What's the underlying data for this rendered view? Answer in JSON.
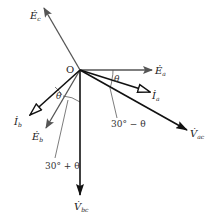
{
  "diagram": {
    "type": "phasor-diagram",
    "origin": {
      "label": "O",
      "x": 80,
      "y": 70
    },
    "phasors": [
      {
        "id": "Ec",
        "symbol": "E",
        "sub": "c",
        "tip": [
          44,
          8
        ],
        "style": "gray-filled",
        "label_pos": [
          28,
          18
        ]
      },
      {
        "id": "Ea",
        "symbol": "E",
        "sub": "a",
        "tip": [
          152,
          70
        ],
        "style": "gray-filled",
        "label_pos": [
          155,
          73
        ]
      },
      {
        "id": "Eb",
        "symbol": "E",
        "sub": "b",
        "tip": [
          46,
          128
        ],
        "style": "gray-filled",
        "label_pos": [
          32,
          140
        ]
      },
      {
        "id": "Ia",
        "symbol": "I",
        "sub": "a",
        "tip": [
          150,
          92
        ],
        "style": "black-open",
        "label_pos": [
          152,
          98
        ]
      },
      {
        "id": "Ib",
        "symbol": "I",
        "sub": "b",
        "tip": [
          30,
          115
        ],
        "style": "black-open",
        "label_pos": [
          14,
          124
        ]
      },
      {
        "id": "Vac",
        "symbol": "V",
        "sub": "ac",
        "tip": [
          187,
          130
        ],
        "style": "black-filled",
        "label_pos": [
          190,
          136
        ]
      },
      {
        "id": "Vbc",
        "symbol": "V",
        "sub": "bc",
        "tip": [
          80,
          195
        ],
        "style": "black-filled",
        "label_pos": [
          74,
          210
        ]
      }
    ],
    "angle_labels": [
      {
        "text": "θ",
        "x": 117,
        "y": 81
      },
      {
        "text": "30° − θ",
        "x": 117,
        "y": 127
      },
      {
        "text": "θ",
        "x": 59,
        "y": 98
      },
      {
        "text": "30° + θ",
        "x": 47,
        "y": 168
      }
    ],
    "colors": {
      "gray": "#555555",
      "black": "#111111"
    }
  }
}
